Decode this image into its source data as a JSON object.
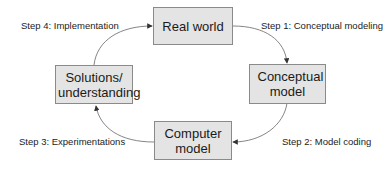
{
  "nodes": {
    "real_world": {
      "label": "Real world"
    },
    "conceptual_model": {
      "label": "Conceptual model"
    },
    "computer_model": {
      "label": "Computer model"
    },
    "solutions": {
      "label": "Solutions/ understanding"
    }
  },
  "steps": {
    "step1": "Step 1:  Conceptual modeling",
    "step2": "Step 2:  Model coding",
    "step3": "Step 3:  Experimentations",
    "step4": "Step 4:  Implementation"
  },
  "colors": {
    "box_fill": "#e4e4e4",
    "box_border": "#8a8a8a",
    "arrow": "#555555"
  }
}
